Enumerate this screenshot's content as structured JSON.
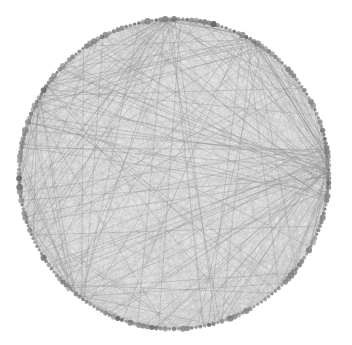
{
  "diagram": {
    "type": "circular-network-graph",
    "layout": "circle",
    "center": [
      174,
      174
    ],
    "radius": 155,
    "node_count": 220,
    "colors": {
      "background": "#ffffff",
      "fill": "#e6e6e6",
      "node": "#7d7d7d",
      "node_dark": "#5e5e5e",
      "edge_light": "#b8b8b8",
      "edge_dark": "#8a8a8a"
    },
    "dense_edge_count": 1400,
    "long_edge_count": 170,
    "hubs": [
      {
        "angle": 92,
        "weight": 30
      },
      {
        "angle": 5,
        "weight": 35
      },
      {
        "angle": 355,
        "weight": 25
      },
      {
        "angle": 150,
        "weight": 22
      },
      {
        "angle": 200,
        "weight": 18
      },
      {
        "angle": 230,
        "weight": 20
      },
      {
        "angle": 60,
        "weight": 15
      }
    ]
  }
}
